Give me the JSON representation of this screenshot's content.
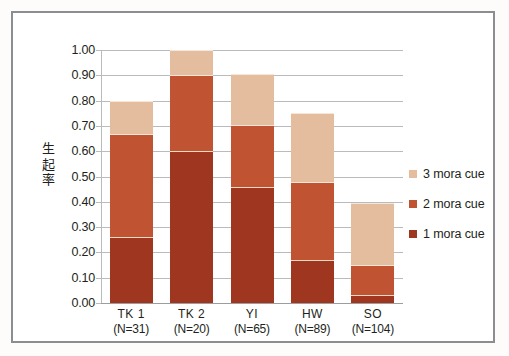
{
  "chart_data": {
    "type": "bar",
    "subtype": "stacked-bar",
    "title": "",
    "xlabel": "",
    "ylabel": "生起率",
    "ylim": [
      0.0,
      1.0
    ],
    "ytick_step": 0.1,
    "ytick_labels": [
      "1.00",
      "0.90",
      "0.80",
      "0.70",
      "0.60",
      "0.50",
      "0.40",
      "0.30",
      "0.20",
      "0.10",
      "0.00"
    ],
    "ytick_values": [
      1.0,
      0.9,
      0.8,
      0.7,
      0.6,
      0.5,
      0.4,
      0.3,
      0.2,
      0.1,
      0.0
    ],
    "grid": true,
    "grid_axis": "y",
    "legend_position": "right",
    "categories": [
      "TK 1",
      "TK 2",
      "YI",
      "HW",
      "SO"
    ],
    "category_sublabels": [
      "(N=31)",
      "(N=20)",
      "(N=65)",
      "(N=89)",
      "(N=104)"
    ],
    "sample_sizes": [
      31,
      20,
      65,
      89,
      104
    ],
    "series": [
      {
        "name": "1 mora cue",
        "color": "#9e3620",
        "values": [
          0.26,
          0.6,
          0.46,
          0.17,
          0.03
        ]
      },
      {
        "name": "2 mora cue",
        "color": "#bf5332",
        "values": [
          0.41,
          0.3,
          0.245,
          0.31,
          0.12
        ]
      },
      {
        "name": "3 mora cue",
        "color": "#e3bd9e",
        "values": [
          0.13,
          0.1,
          0.2,
          0.27,
          0.245
        ]
      }
    ],
    "cumulative_tops": [
      {
        "category": "TK 1",
        "one_mora": 0.26,
        "two_mora_top": 0.67,
        "three_mora_top": 0.8
      },
      {
        "category": "TK 2",
        "one_mora": 0.6,
        "two_mora_top": 0.9,
        "three_mora_top": 1.0
      },
      {
        "category": "YI",
        "one_mora": 0.46,
        "two_mora_top": 0.705,
        "three_mora_top": 0.905
      },
      {
        "category": "HW",
        "one_mora": 0.17,
        "two_mora_top": 0.48,
        "three_mora_top": 0.75
      },
      {
        "category": "SO",
        "one_mora": 0.03,
        "two_mora_top": 0.15,
        "three_mora_top": 0.395
      }
    ]
  },
  "legend": {
    "entries": [
      {
        "label": "3 mora cue",
        "color": "#e3bd9e"
      },
      {
        "label": "2 mora cue",
        "color": "#bf5332"
      },
      {
        "label": "1 mora cue",
        "color": "#9e3620"
      }
    ]
  },
  "axis": {
    "y_title_chars": [
      "生",
      "起",
      "率"
    ]
  },
  "colors": {
    "three_mora": "#e3bd9e",
    "two_mora": "#bf5332",
    "one_mora": "#9e3620",
    "gridline": "#b9bbbd",
    "frame": "#8b8d90",
    "text": "#231f20",
    "background": "#ffffff"
  }
}
